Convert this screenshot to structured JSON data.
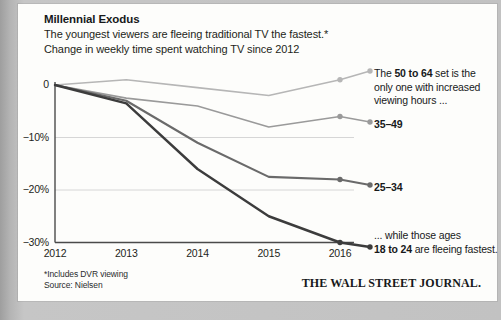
{
  "card": {
    "title": "Millennial Exodus",
    "subtitle_1": "The youngest viewers are fleeing traditional TV the fastest.*",
    "subtitle_2": "Change in weekly time spent watching TV since 2012"
  },
  "footer": {
    "note": "*Includes DVR viewing",
    "source": "Source: Nielsen",
    "publisher": "THE WALL STREET JOURNAL."
  },
  "annotations": [
    {
      "id": "anno-50-64",
      "line_1_pre": "The ",
      "line_1_bold": "50 to 64",
      "line_1_post": " set is the",
      "line_2": "only one with increased",
      "line_3": "viewing hours ..."
    },
    {
      "id": "anno-35-49",
      "label": "35–49"
    },
    {
      "id": "anno-25-34",
      "label": "25–34"
    },
    {
      "id": "anno-18-24",
      "line_1": "... while those ages",
      "line_2_bold": "18 to 24",
      "line_2_post": " are fleeing fastest."
    }
  ],
  "colors": {
    "series_50_64": "#b6b6b6",
    "series_35_49": "#9a9a9a",
    "series_25_34": "#6a6a6a",
    "series_18_24": "#3c3c3c",
    "axis": "#4a4a4a",
    "grid": "#d6d6d6",
    "card_bg": "#fdfdfb",
    "text": "#17191a"
  },
  "chart_data": {
    "type": "line",
    "title": "Millennial Exodus",
    "subtitle": "Change in weekly time spent watching TV since 2012",
    "xlabel": "",
    "ylabel": "",
    "x": [
      2012,
      2013,
      2014,
      2015,
      2016
    ],
    "xtick_labels": [
      "2012",
      "2013",
      "2014",
      "2015",
      "2016"
    ],
    "ytick_labels": [
      "0",
      "−10%",
      "−20%",
      "−30%"
    ],
    "yticks": [
      0,
      -10,
      -20,
      -30
    ],
    "ylim": [
      -32,
      3
    ],
    "xlim": [
      2012,
      2016
    ],
    "grid": "horizontal",
    "legend_position": "inline-right-endpoints",
    "unit": "percent change since 2012",
    "series": [
      {
        "name": "50 to 64",
        "values": [
          0,
          1,
          -0.5,
          -2,
          1
        ],
        "color": "#b6b6b6",
        "endpoint_label": "The 50 to 64 set is the only one with increased viewing hours ..."
      },
      {
        "name": "35–49",
        "values": [
          0,
          -2.5,
          -4,
          -8,
          -6
        ],
        "color": "#9a9a9a",
        "endpoint_label": "35–49"
      },
      {
        "name": "25–34",
        "values": [
          0,
          -3,
          -11,
          -17.5,
          -18
        ],
        "color": "#6a6a6a",
        "endpoint_label": "25–34"
      },
      {
        "name": "18 to 24",
        "values": [
          0,
          -3.5,
          -16,
          -25,
          -30
        ],
        "color": "#3c3c3c",
        "endpoint_label": "... while those ages 18 to 24 are fleeing fastest."
      }
    ]
  }
}
